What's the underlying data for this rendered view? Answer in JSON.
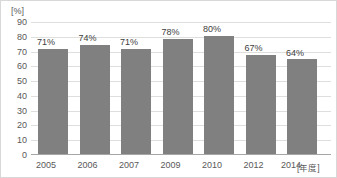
{
  "chart_data": {
    "type": "bar",
    "title": "",
    "subtitle": "",
    "categories": [
      "2005",
      "2006",
      "2007",
      "2009",
      "2010",
      "2012",
      "2014"
    ],
    "values": [
      71,
      74,
      71,
      78,
      80,
      67,
      64
    ],
    "data_labels": [
      "71%",
      "74%",
      "71%",
      "78%",
      "80%",
      "67%",
      "64%"
    ],
    "xlabel": "[年度]",
    "ylabel": "[%]",
    "ylim": [
      0,
      90
    ],
    "ytick_labels": [
      "90",
      "80",
      "70",
      "60",
      "50",
      "40",
      "30",
      "20",
      "10",
      "0"
    ],
    "ytick_values": [
      90,
      80,
      70,
      60,
      50,
      40,
      30,
      20,
      10,
      0
    ],
    "grid": true,
    "grid_axis": "y",
    "legend": false,
    "legend_position": "none",
    "series": [
      {
        "name": "",
        "values": [
          71,
          74,
          71,
          78,
          80,
          67,
          64
        ],
        "color": "#808080"
      }
    ]
  },
  "colors": {
    "bar_fill": "#808080",
    "gridline": "#dededc",
    "axis_line": "#a6a6a6",
    "tick_text": "#595959",
    "label_text": "#404040",
    "frame_border": "#d8d8d8",
    "background": "#ffffff"
  }
}
